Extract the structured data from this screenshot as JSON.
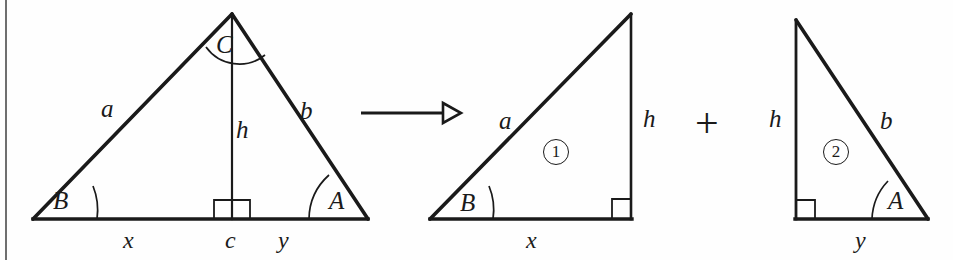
{
  "figure": {
    "stroke_color": "#1a1a1a",
    "background_color": "#fefefe",
    "rule_color": "#6f6f6f"
  },
  "operators": {
    "arrow": "arrow-right",
    "plus": "+"
  },
  "triangle_original": {
    "name": "oblique-triangle",
    "angles": {
      "apex": "C",
      "left": "B",
      "right": "A"
    },
    "sides": {
      "left": "a",
      "right": "b",
      "altitude": "h"
    },
    "base_segments": {
      "left": "x",
      "foot": "c",
      "right": "y"
    },
    "right_angle_marker": true
  },
  "triangle_one": {
    "name": "right-triangle-one",
    "number": "1",
    "angles": {
      "left": "B"
    },
    "sides": {
      "hypotenuse": "a",
      "vertical": "h"
    },
    "base": "x",
    "right_angle_marker": true
  },
  "triangle_two": {
    "name": "right-triangle-two",
    "number": "2",
    "angles": {
      "right": "A"
    },
    "sides": {
      "hypotenuse": "b",
      "vertical": "h"
    },
    "base": "y",
    "right_angle_marker": true
  }
}
